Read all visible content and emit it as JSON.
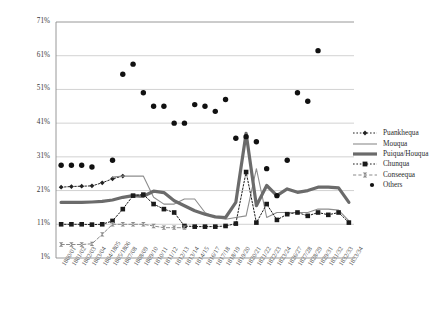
{
  "chart_data": {
    "type": "line",
    "title": "",
    "xlabel": "",
    "ylabel": "",
    "ylim": [
      1,
      71
    ],
    "yticks": [
      "1%",
      "11%",
      "21%",
      "31%",
      "41%",
      "51%",
      "61%",
      "71%"
    ],
    "ytick_values": [
      1,
      11,
      21,
      31,
      41,
      51,
      61,
      71
    ],
    "grid": "horizontal",
    "legend_position": "right",
    "categories": [
      "1800/01",
      "1801/02",
      "1802/03",
      "1803/04",
      "1804/1805",
      "1805/1806",
      "1807/08",
      "1808/09",
      "1809/10",
      "1810/11",
      "1811/12",
      "1812/13",
      "1813/14",
      "1814/15",
      "1816/17",
      "1817/18",
      "1818/19",
      "1819/20",
      "1820/21",
      "1821/22",
      "1822/23",
      "1823/24",
      "1826/27",
      "1827/28",
      "1828/29",
      "1829/31",
      "1831/32",
      "1832/33",
      "1833/34"
    ],
    "series": [
      {
        "name": "Puankhequa",
        "style": "dotted-diamond",
        "color": "#222222",
        "values": [
          22.0,
          22.2,
          22.3,
          22.4,
          23.3,
          24.5,
          25.3,
          null,
          null,
          null,
          null,
          null,
          null,
          null,
          null,
          null,
          null,
          null,
          null,
          null,
          null,
          null,
          null,
          null,
          null,
          null,
          null,
          null,
          null
        ]
      },
      {
        "name": "Mouqua",
        "style": "thin-solid",
        "color": "#8d8d8d",
        "values": [
          null,
          null,
          null,
          null,
          null,
          25.0,
          25.3,
          25.3,
          25.3,
          19.0,
          17.0,
          17.0,
          18.5,
          18.5,
          14.5,
          13.0,
          12.5,
          13.0,
          13.5,
          27.5,
          13.0,
          14.5,
          14.5,
          14.5,
          14.5,
          15.5,
          15.5,
          15.2,
          12.0
        ]
      },
      {
        "name": "Puiqua/Houqua",
        "style": "thick-solid",
        "color": "#6b6b6b",
        "values": [
          17.5,
          17.5,
          17.5,
          17.6,
          17.8,
          18.2,
          19.0,
          19.5,
          19.3,
          20.8,
          20.4,
          18.0,
          16.5,
          15.0,
          14.0,
          13.2,
          13.0,
          17.5,
          38.0,
          16.5,
          22.5,
          19.5,
          21.5,
          20.5,
          21.0,
          22.0,
          22.0,
          21.8,
          17.5
        ]
      },
      {
        "name": "Chunqua",
        "style": "dotted-square",
        "color": "#1a1a1a",
        "values": [
          11.0,
          11.0,
          11.0,
          10.9,
          11.0,
          12.0,
          15.5,
          19.5,
          19.8,
          17.0,
          15.5,
          14.5,
          10.5,
          10.3,
          10.3,
          10.3,
          10.5,
          11.2,
          26.5,
          11.5,
          17.0,
          12.3,
          14.0,
          14.5,
          13.5,
          14.5,
          13.8,
          14.5,
          11.5
        ]
      },
      {
        "name": "Conseequa",
        "style": "dashed-hourglass",
        "color": "#8a8a8a",
        "values": [
          5.0,
          5.0,
          5.0,
          5.2,
          8.0,
          11.0,
          11.0,
          11.0,
          11.0,
          10.5,
          10.0,
          10.0,
          10.0,
          null,
          null,
          null,
          null,
          null,
          null,
          null,
          null,
          null,
          null,
          null,
          null,
          null,
          null,
          null,
          null
        ]
      },
      {
        "name": "Others",
        "style": "scatter-dot",
        "color": "#111111",
        "values": [
          28.5,
          28.5,
          28.5,
          28.0,
          null,
          30.0,
          55.5,
          58.5,
          50.0,
          46.0,
          46.0,
          41.0,
          41.0,
          46.5,
          46.0,
          44.5,
          48.0,
          36.5,
          37.0,
          35.5,
          27.5,
          19.5,
          30.0,
          50.0,
          47.5,
          62.5,
          null,
          null,
          null
        ]
      }
    ],
    "legend": [
      {
        "label": "Puankhequa",
        "marker": "dotted-diamond"
      },
      {
        "label": "Mouqua",
        "marker": "thin-solid"
      },
      {
        "label": "Puiqua/Houqua",
        "marker": "thick-solid"
      },
      {
        "label": "Chunqua",
        "marker": "dotted-square"
      },
      {
        "label": "Conseequa",
        "marker": "dashed-hourglass"
      },
      {
        "label": "Others",
        "marker": "scatter-dot"
      }
    ]
  }
}
